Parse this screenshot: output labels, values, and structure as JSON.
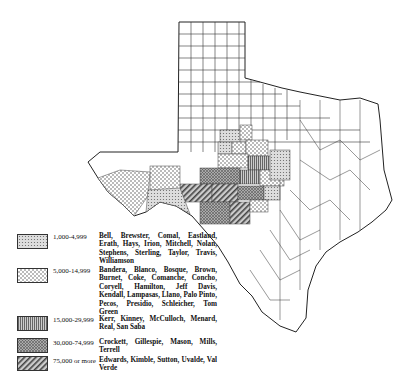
{
  "map": {
    "subject": "Texas counties",
    "legend": [
      {
        "range": "1,000-4,999",
        "pattern": "fine-stipple",
        "counties": "Bell, Brewster, Comal, Eastland, Erath, Hays, Irion, Mitchell, Nolan, Stephens, Sterling, Taylor, Travis, Williamson"
      },
      {
        "range": "5,000-14,999",
        "pattern": "checker-dots",
        "counties": "Bandera, Blanco, Bosque, Brown, Burnet, Coke, Comanche, Concho, Coryell, Hamilton, Jeff Davis, Kendall, Lampasas, Llano, Palo Pinto, Pecos, Presidio, Schleicher, Tom Green"
      },
      {
        "range": "15,000-29,999",
        "pattern": "vertical-lines",
        "counties": "Kerr, Kinney, McCulloch, Menard, Real, San Saba"
      },
      {
        "range": "30,000-74,999",
        "pattern": "crosshatch",
        "counties": "Crockett, Gillespie, Mason, Mills, Terrell"
      },
      {
        "range": "75,000 or more",
        "pattern": "diagonal-lines",
        "counties": "Edwards, Kimble, Sutton, Uvalde, Val Verde"
      }
    ]
  }
}
